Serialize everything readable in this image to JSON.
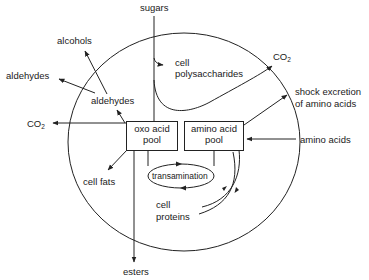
{
  "diagram": {
    "type": "metabolic-flow",
    "colors": {
      "line": "#222222",
      "text": "#1a1a1a",
      "background": "#ffffff"
    },
    "boxes": {
      "oxo": {
        "line1": "oxo acid",
        "line2": "pool"
      },
      "amino": {
        "line1": "amino acid",
        "line2": "pool"
      }
    },
    "oval": {
      "label": "transamination"
    },
    "labels": {
      "sugars": "sugars",
      "cell_polysaccharides_1": "cell",
      "cell_polysaccharides_2": "polysaccharides",
      "alcohols": "alcohols",
      "aldehydes_outer": "aldehydes",
      "aldehydes_inner": "aldehydes",
      "co2_left_main": "CO",
      "co2_left_sub": "2",
      "co2_right_main": "CO",
      "co2_right_sub": "2",
      "shock_1": "shock excretion",
      "shock_2": "of amino acids",
      "amino_acids_in": "amino acids",
      "cell_fats": "cell fats",
      "cell_proteins_1": "cell",
      "cell_proteins_2": "proteins",
      "esters": "esters"
    },
    "edges": [
      {
        "from": "sugars",
        "to": "oxo acid pool"
      },
      {
        "from": "sugars",
        "to": "cell polysaccharides"
      },
      {
        "from": "sugars",
        "to": "CO2 (right)"
      },
      {
        "from": "oxo acid pool",
        "to": "aldehydes (inner)"
      },
      {
        "from": "aldehydes (inner)",
        "to": "alcohols"
      },
      {
        "from": "aldehydes (inner)",
        "to": "aldehydes (outer)"
      },
      {
        "from": "oxo acid pool",
        "to": "CO2 (left)"
      },
      {
        "from": "oxo acid pool",
        "to": "cell fats"
      },
      {
        "from": "oxo acid pool",
        "to": "esters"
      },
      {
        "from": "amino acid pool",
        "to": "shock excretion of amino acids"
      },
      {
        "from": "amino acids",
        "to": "amino acid pool"
      },
      {
        "from": "amino acid pool",
        "to": "cell proteins"
      },
      {
        "from": "cell proteins",
        "to": "amino acid pool"
      },
      {
        "from": "oxo acid pool",
        "to": "amino acid pool",
        "via": "transamination"
      },
      {
        "from": "amino acid pool",
        "to": "oxo acid pool",
        "via": "transamination"
      }
    ]
  }
}
